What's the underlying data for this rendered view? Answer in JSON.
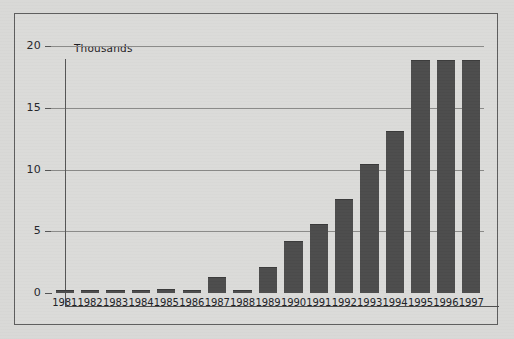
{
  "chart_data": {
    "type": "bar",
    "title": "",
    "subtitle": "",
    "axis_note": "Thousands",
    "xlabel": "",
    "ylabel": "Thousands",
    "ylim": [
      0,
      20
    ],
    "yticks": [
      0,
      5,
      10,
      15,
      20
    ],
    "ytick_labels": [
      "0",
      "5",
      "10",
      "15",
      "20"
    ],
    "grid": true,
    "gridlines_at": [
      5,
      10,
      15,
      20
    ],
    "legend": "none",
    "bar_color": "#4c4c4c",
    "background_color": "#dbdbd9",
    "categories": [
      "1981",
      "1982",
      "1983",
      "1984",
      "1985",
      "1986",
      "1987",
      "1988",
      "1989",
      "1990",
      "1991",
      "1992",
      "1993",
      "1994",
      "1995",
      "1996",
      "1997"
    ],
    "values": [
      0.1,
      0.05,
      0.15,
      0.05,
      0.25,
      0.05,
      1.2,
      0.05,
      2.0,
      4.1,
      5.5,
      7.5,
      10.4,
      13.0,
      18.8,
      18.8,
      18.8
    ],
    "series": [
      {
        "name": "",
        "values": [
          0.1,
          0.05,
          0.15,
          0.05,
          0.25,
          0.05,
          1.2,
          0.05,
          2.0,
          4.1,
          5.5,
          7.5,
          10.4,
          13.0,
          18.8,
          18.8,
          18.8
        ]
      }
    ],
    "annotations": []
  }
}
